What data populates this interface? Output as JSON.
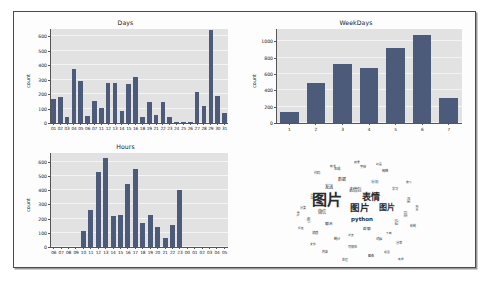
{
  "figure": {
    "background": "#fdfdfd",
    "border_color": "#4a4a4a",
    "bar_color": "#4c5b7a",
    "plot_bg": "#e2e2e2",
    "grid_color": "#f4f4f4"
  },
  "chart_data": [
    {
      "type": "bar",
      "name": "days-chart",
      "title": "Days",
      "xlabel": "",
      "ylabel": "count",
      "ylim": [
        0,
        650
      ],
      "yticks": [
        0,
        100,
        200,
        300,
        400,
        500,
        600
      ],
      "grid": true,
      "legend": "none",
      "categories": [
        "01",
        "02",
        "03",
        "04",
        "05",
        "06",
        "07",
        "11",
        "12",
        "13",
        "14",
        "15",
        "16",
        "18",
        "19",
        "21",
        "22",
        "23",
        "24",
        "25",
        "26",
        "27",
        "28",
        "29",
        "30",
        "31"
      ],
      "values": [
        165,
        182,
        45,
        372,
        290,
        50,
        152,
        103,
        280,
        280,
        82,
        268,
        315,
        45,
        145,
        52,
        145,
        42,
        8,
        8,
        8,
        215,
        120,
        640,
        190,
        70
      ]
    },
    {
      "type": "bar",
      "name": "weekdays-chart",
      "title": "WeekDays",
      "xlabel": "",
      "ylabel": "count",
      "ylim": [
        0,
        1150
      ],
      "yticks": [
        0,
        200,
        400,
        600,
        800,
        1000
      ],
      "grid": true,
      "legend": "none",
      "categories": [
        "1",
        "2",
        "3",
        "4",
        "5",
        "6",
        "7"
      ],
      "values": [
        140,
        490,
        720,
        670,
        920,
        1080,
        300
      ]
    },
    {
      "type": "bar",
      "name": "hours-chart",
      "title": "Hours",
      "xlabel": "",
      "ylabel": "count",
      "ylim": [
        0,
        660
      ],
      "yticks": [
        0,
        100,
        200,
        300,
        400,
        500,
        600
      ],
      "grid": true,
      "legend": "none",
      "categories": [
        "06",
        "07",
        "08",
        "09",
        "10",
        "11",
        "12",
        "13",
        "14",
        "15",
        "16",
        "17",
        "18",
        "19",
        "20",
        "21",
        "22",
        "23",
        "00",
        "01",
        "02",
        "03",
        "04",
        "05"
      ],
      "values": [
        0,
        0,
        0,
        0,
        115,
        260,
        525,
        625,
        220,
        228,
        445,
        548,
        168,
        222,
        143,
        65,
        155,
        400,
        0,
        0,
        0,
        0,
        0,
        0
      ]
    }
  ],
  "wordcloud": {
    "name": "wordcloud-image",
    "shape": "cartoon-figure-silhouette",
    "primary_words": [
      "图片",
      "表情",
      "python"
    ],
    "words": [
      {
        "text": "图片",
        "size": 15,
        "x": 60,
        "y": 48,
        "rot": 0,
        "weight": 700
      },
      {
        "text": "表情",
        "size": 9,
        "x": 104,
        "y": 45,
        "rot": 0,
        "weight": 700
      },
      {
        "text": "图片",
        "size": 9.5,
        "x": 93,
        "y": 56,
        "rot": 0,
        "weight": 700
      },
      {
        "text": "图片",
        "size": 8,
        "x": 120,
        "y": 56,
        "rot": 0,
        "weight": 700
      },
      {
        "text": "python",
        "size": 5.5,
        "x": 95,
        "y": 68,
        "rot": 0,
        "weight": 700
      },
      {
        "text": "表情包",
        "size": 4.5,
        "x": 88,
        "y": 38,
        "rot": 0,
        "weight": 400
      },
      {
        "text": "发送",
        "size": 4.2,
        "x": 62,
        "y": 35,
        "rot": 0,
        "weight": 400
      },
      {
        "text": "数据",
        "size": 4,
        "x": 75,
        "y": 28,
        "rot": 0,
        "weight": 400
      },
      {
        "text": "分析",
        "size": 3.8,
        "x": 108,
        "y": 30,
        "rot": 0,
        "weight": 400
      },
      {
        "text": "微信",
        "size": 4.2,
        "x": 55,
        "y": 60,
        "rot": 0,
        "weight": 400
      },
      {
        "text": "聊天",
        "size": 3.8,
        "x": 62,
        "y": 72,
        "rot": 0,
        "weight": 400
      },
      {
        "text": "群聊",
        "size": 3.6,
        "x": 100,
        "y": 78,
        "rot": 0,
        "weight": 400
      },
      {
        "text": "记录",
        "size": 3.4,
        "x": 128,
        "y": 70,
        "rot": 90,
        "weight": 400
      },
      {
        "text": "好友",
        "size": 3.4,
        "x": 137,
        "y": 62,
        "rot": 90,
        "weight": 400
      },
      {
        "text": "消息",
        "size": 3.5,
        "x": 48,
        "y": 82,
        "rot": 0,
        "weight": 400
      },
      {
        "text": "统计",
        "size": 3.3,
        "x": 70,
        "y": 88,
        "rot": 0,
        "weight": 400
      },
      {
        "text": "词云",
        "size": 3.5,
        "x": 112,
        "y": 88,
        "rot": 0,
        "weight": 400
      },
      {
        "text": "可视化",
        "size": 3.2,
        "x": 85,
        "y": 96,
        "rot": 0,
        "weight": 400
      },
      {
        "text": "分享",
        "size": 3.2,
        "x": 132,
        "y": 92,
        "rot": 0,
        "weight": 400
      },
      {
        "text": "生成",
        "size": 3.4,
        "x": 70,
        "y": 18,
        "rot": 0,
        "weight": 400
      },
      {
        "text": "字体",
        "size": 3.2,
        "x": 96,
        "y": 16,
        "rot": 0,
        "weight": 400
      },
      {
        "text": "网络",
        "size": 3.2,
        "x": 118,
        "y": 20,
        "rot": 0,
        "weight": 400
      },
      {
        "text": "代码",
        "size": 3.3,
        "x": 50,
        "y": 22,
        "rot": 0,
        "weight": 400
      },
      {
        "text": "学习",
        "size": 3.1,
        "x": 128,
        "y": 38,
        "rot": 0,
        "weight": 400
      },
      {
        "text": "工具",
        "size": 3.1,
        "x": 44,
        "y": 44,
        "rot": 90,
        "weight": 400
      },
      {
        "text": "用户",
        "size": 3.0,
        "x": 40,
        "y": 68,
        "rot": 90,
        "weight": 400
      },
      {
        "text": "时间",
        "size": 3.0,
        "x": 140,
        "y": 48,
        "rot": 90,
        "weight": 400
      },
      {
        "text": "内容",
        "size": 3.0,
        "x": 58,
        "y": 100,
        "rot": 0,
        "weight": 400
      },
      {
        "text": "图像",
        "size": 3.0,
        "x": 104,
        "y": 104,
        "rot": 0,
        "weight": 400
      },
      {
        "text": "处理",
        "size": 2.9,
        "x": 78,
        "y": 108,
        "rot": 0,
        "weight": 400
      },
      {
        "text": "分类",
        "size": 2.9,
        "x": 36,
        "y": 56,
        "rot": 0,
        "weight": 400
      },
      {
        "text": "绘制",
        "size": 2.9,
        "x": 146,
        "y": 74,
        "rot": 0,
        "weight": 400
      },
      {
        "text": "结果",
        "size": 2.8,
        "x": 90,
        "y": 10,
        "rot": 0,
        "weight": 400
      },
      {
        "text": "项目",
        "size": 2.8,
        "x": 120,
        "y": 100,
        "rot": 0,
        "weight": 400
      },
      {
        "text": "文件",
        "size": 2.8,
        "x": 46,
        "y": 92,
        "rot": 0,
        "weight": 400
      },
      {
        "text": "输出",
        "size": 2.8,
        "x": 150,
        "y": 56,
        "rot": 90,
        "weight": 400
      },
      {
        "text": "转发",
        "size": 2.7,
        "x": 66,
        "y": 14,
        "rot": 0,
        "weight": 400
      },
      {
        "text": "封面",
        "size": 2.7,
        "x": 112,
        "y": 12,
        "rot": 0,
        "weight": 400
      },
      {
        "text": "标签",
        "size": 2.7,
        "x": 34,
        "y": 76,
        "rot": 0,
        "weight": 400
      },
      {
        "text": "搜索",
        "size": 2.7,
        "x": 142,
        "y": 30,
        "rot": 0,
        "weight": 400
      },
      {
        "text": "浏览",
        "size": 2.6,
        "x": 84,
        "y": 84,
        "rot": 0,
        "weight": 400
      },
      {
        "text": "下载",
        "size": 2.6,
        "x": 122,
        "y": 82,
        "rot": 0,
        "weight": 400
      },
      {
        "text": "升级",
        "size": 2.6,
        "x": 54,
        "y": 52,
        "rot": 0,
        "weight": 400
      },
      {
        "text": "完成",
        "size": 2.6,
        "x": 134,
        "y": 108,
        "rot": 0,
        "weight": 400
      },
      {
        "text": "地址",
        "size": 2.5,
        "x": 30,
        "y": 62,
        "rot": 90,
        "weight": 400
      }
    ]
  }
}
